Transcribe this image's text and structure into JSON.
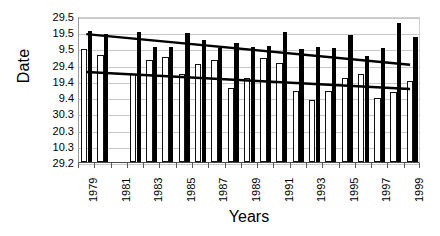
{
  "chart_data": {
    "type": "bar",
    "title": "",
    "subtitle": "",
    "xlabel": "Years",
    "ylabel": "Date",
    "grid": true,
    "legend": "none",
    "orientation": "vertical",
    "bar_style": "paired grouped columns; open/white bar then solid/black bar per year",
    "x": [
      1979,
      1980,
      1981,
      1982,
      1983,
      1984,
      1985,
      1986,
      1987,
      1988,
      1989,
      1990,
      1991,
      1992,
      1993,
      1994,
      1995,
      1996,
      1997,
      1998,
      1999
    ],
    "categories": [
      "1979",
      "1980",
      "1981",
      "1982",
      "1983",
      "1984",
      "1985",
      "1986",
      "1987",
      "1988",
      "1989",
      "1990",
      "1991",
      "1992",
      "1993",
      "1994",
      "1995",
      "1996",
      "1997",
      "1998",
      "1999"
    ],
    "xtick_labels": [
      "1979",
      "1981",
      "1983",
      "1985",
      "1987",
      "1989",
      "1991",
      "1993",
      "1995",
      "1997",
      "1999"
    ],
    "xtick_values": [
      1979,
      1981,
      1983,
      1985,
      1987,
      1989,
      1991,
      1993,
      1995,
      1997,
      1999
    ],
    "ytick_labels": [
      "29.5",
      "19.5",
      "9.5",
      "29.4",
      "19.4",
      "9.4",
      "30.3",
      "20.3",
      "10.3",
      "29.2"
    ],
    "ytick_index": [
      9,
      8,
      7,
      6,
      5,
      4,
      3,
      2,
      1,
      0
    ],
    "yaxis_note": "Tick labels are calendar dates (day.month) running from 29.2 at the axis base up to 29.5 at the top; each gridline step equals ten days.",
    "ylim_index": [
      0,
      9
    ],
    "colors": {
      "bar_open_fill": "#ffffff",
      "bar_open_edge": "#111111",
      "bar_filled": "#000000",
      "trend_line": "#000000",
      "gridline": "#c8c8c8",
      "axis": "#4a4a4a",
      "background": "#ffffff"
    },
    "series": [
      {
        "name": "Open bars",
        "style": "white bar with black outline",
        "values": [
          6.95,
          6.6,
          null,
          5.45,
          6.3,
          6.45,
          5.45,
          6.05,
          6.3,
          4.55,
          5.15,
          6.4,
          6.1,
          4.4,
          3.8,
          4.4,
          5.2,
          5.45,
          3.95,
          4.3,
          5.0
        ]
      },
      {
        "name": "Solid bars",
        "style": "black filled bar",
        "values": [
          8.05,
          7.9,
          null,
          8.0,
          7.1,
          7.1,
          7.95,
          7.5,
          7.05,
          7.35,
          7.1,
          7.15,
          8.0,
          6.95,
          7.1,
          7.05,
          7.85,
          6.55,
          7.05,
          8.6,
          7.7
        ]
      }
    ],
    "trend_lines": [
      {
        "name": "Trend of solid bars",
        "direction": "decreasing",
        "start_xy": [
          1979,
          8.0
        ],
        "end_xy": [
          1999,
          6.1
        ],
        "style": "thick black straight line"
      },
      {
        "name": "Trend of open bars",
        "direction": "decreasing",
        "start_xy": [
          1979,
          5.65
        ],
        "end_xy": [
          1999,
          4.6
        ],
        "style": "thick black straight line"
      }
    ]
  },
  "axes": {
    "y_title": "Date",
    "x_title": "Years"
  }
}
